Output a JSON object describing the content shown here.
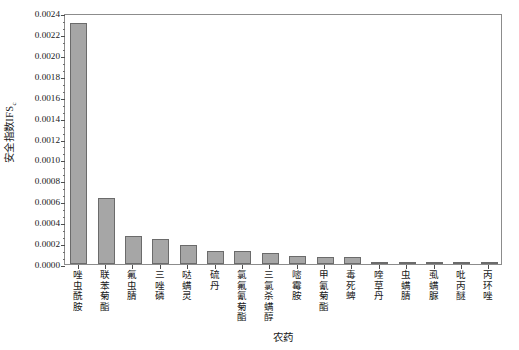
{
  "chart_data": {
    "type": "bar",
    "title": "",
    "xlabel": "农药",
    "ylabel": "安全指数IFS",
    "ylabel_subscript": "c",
    "ylim": [
      0.0,
      0.0024
    ],
    "ytick_step": 0.0002,
    "minor_ticks_per_interval": 2,
    "grid": false,
    "legend": null,
    "bar_color": "#a6a6a6",
    "bar_edge_color": "#6b6b6b",
    "axis_color": "#8c8c8c",
    "categories": [
      "唑虫酰胺",
      "联苯菊酯",
      "氟虫腈",
      "三唑磷",
      "哒螨灵",
      "硫丹",
      "氯氟氰菊酯",
      "三氯杀螨醇",
      "嘧霉胺",
      "甲氰菊酯",
      "毒死蜱",
      "喹草丹",
      "虫螨腈",
      "虱螨脲",
      "吡丙醚",
      "丙环唑"
    ],
    "values": [
      0.0023,
      0.00063,
      0.00027,
      0.00024,
      0.00018,
      0.00012,
      0.00012,
      0.00011,
      8e-05,
      7e-05,
      7e-05,
      2e-05,
      1e-05,
      8e-06,
      4e-06,
      2e-06
    ],
    "ytick_labels": [
      "0.0000",
      "0.0002",
      "0.0004",
      "0.0006",
      "0.0008",
      "0.0010",
      "0.0012",
      "0.0014",
      "0.0016",
      "0.0018",
      "0.0020",
      "0.0022",
      "0.0024"
    ],
    "ytick_values": [
      0.0,
      0.0002,
      0.0004,
      0.0006,
      0.0008,
      0.001,
      0.0012,
      0.0014,
      0.0016,
      0.0018,
      0.002,
      0.0022,
      0.0024
    ]
  }
}
